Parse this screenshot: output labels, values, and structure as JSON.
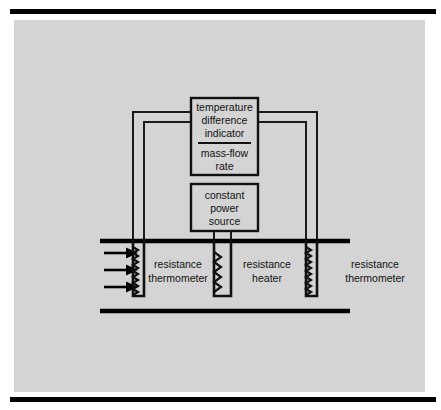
{
  "figure": {
    "background_color": "#d4d4d4",
    "line_color": "#111111",
    "page_color": "#ffffff"
  },
  "blocks": {
    "indicator": {
      "name": "temperature-difference-indicator",
      "numerator_lines": [
        "temperature",
        "difference",
        "indicator"
      ],
      "denominator_lines": [
        "mass-flow",
        "rate"
      ],
      "has_fraction_rule": true
    },
    "power_source": {
      "name": "constant-power-source",
      "lines": [
        "constant",
        "power",
        "source"
      ]
    }
  },
  "duct": {
    "name": "flow-duct",
    "flow_arrow_count": 3,
    "flow_direction": "left-to-right"
  },
  "sensors": [
    {
      "id": "upstream-thermometer",
      "lines": [
        "resistance",
        "thermometer"
      ],
      "element_type": "coil"
    },
    {
      "id": "heater",
      "lines": [
        "resistance",
        "heater"
      ],
      "element_type": "coil"
    },
    {
      "id": "downstream-thermometer",
      "lines": [
        "resistance",
        "thermometer"
      ],
      "element_type": "coil"
    }
  ]
}
